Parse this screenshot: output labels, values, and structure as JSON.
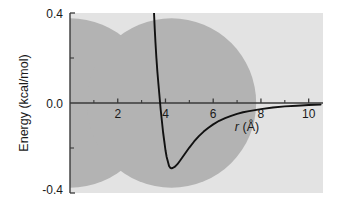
{
  "chart_data": {
    "type": "line",
    "title": "",
    "subtitle": "",
    "xlabel": "r (Å)",
    "xlabel_italic_part": "r",
    "xlabel_unit_part": " (Å)",
    "ylabel": "Energy (kcal/mol)",
    "xlim": [
      0,
      10.6
    ],
    "ylim": [
      -0.4,
      0.4
    ],
    "grid": false,
    "legend": null,
    "x_major_ticks": [
      2,
      4,
      6,
      8,
      10
    ],
    "x_major_tick_labels": [
      "2",
      "4",
      "6",
      "8",
      "10"
    ],
    "x_minor_ticks": [
      1,
      3,
      5,
      7,
      9
    ],
    "y_major_ticks": [
      -0.4,
      0.0,
      0.4
    ],
    "y_major_tick_labels": [
      "-0.4",
      "0.0",
      "0.4"
    ],
    "y_minor_ticks": [
      -0.2,
      0.2
    ],
    "zero_crossing_r": 3.7,
    "minimum_point": {
      "r": 4.25,
      "energy": -0.29
    },
    "series": [
      {
        "name": "Lennard-Jones potential",
        "color": "#111111",
        "x": [
          3.52,
          3.55,
          3.58,
          3.62,
          3.66,
          3.7,
          3.75,
          3.8,
          3.85,
          3.9,
          3.95,
          4.0,
          4.05,
          4.1,
          4.15,
          4.2,
          4.25,
          4.3,
          4.4,
          4.5,
          4.6,
          4.8,
          5.0,
          5.2,
          5.4,
          5.6,
          5.8,
          6.0,
          6.25,
          6.5,
          6.75,
          7.0,
          7.25,
          7.5,
          8.0,
          8.5,
          9.0,
          9.5,
          10.0,
          10.5
        ],
        "y": [
          0.4,
          0.33,
          0.27,
          0.2,
          0.14,
          0.09,
          0.03,
          -0.03,
          -0.08,
          -0.13,
          -0.17,
          -0.21,
          -0.24,
          -0.26,
          -0.28,
          -0.288,
          -0.29,
          -0.289,
          -0.283,
          -0.272,
          -0.258,
          -0.228,
          -0.198,
          -0.171,
          -0.147,
          -0.127,
          -0.11,
          -0.095,
          -0.079,
          -0.067,
          -0.057,
          -0.048,
          -0.041,
          -0.036,
          -0.027,
          -0.02,
          -0.015,
          -0.012,
          -0.009,
          -0.007
        ]
      }
    ],
    "annotations": [
      {
        "name": "atom-sphere-left",
        "center_r": 0.0,
        "center_energy": 0.0,
        "radius_r": 3.55,
        "color": "#b3b3b3"
      },
      {
        "name": "atom-sphere-right",
        "center_r": 4.25,
        "center_energy": 0.0,
        "radius_r": 3.55,
        "color": "#b3b3b3"
      }
    ],
    "colors": {
      "plot_background": "#e3e3e3",
      "page_background": "#ffffff",
      "curve": "#111111",
      "axis": "#3a3a3a",
      "sphere": "#b3b3b3",
      "text": "#1a1a1a"
    }
  }
}
